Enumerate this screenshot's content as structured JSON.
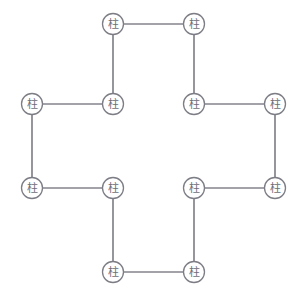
{
  "diagram": {
    "type": "cross-shaped column grid",
    "node_symbol": "柱",
    "node_symbol_name": "column-symbol",
    "node_radius": 10.5,
    "colors": {
      "edge": "#83838b",
      "node_stroke": "#7d7d86",
      "node_fill": "#ffffff",
      "glyph": "#6e6e78",
      "background": "#ffffff"
    },
    "nodes": [
      {
        "id": "C1",
        "label": "柱",
        "x": 113,
        "y": 24,
        "name": "column-node-top-left"
      },
      {
        "id": "C2",
        "label": "柱",
        "x": 194,
        "y": 24,
        "name": "column-node-top-right"
      },
      {
        "id": "C3",
        "label": "柱",
        "x": 194,
        "y": 104,
        "name": "column-node-upper-inner-right"
      },
      {
        "id": "C4",
        "label": "柱",
        "x": 275,
        "y": 104,
        "name": "column-node-right-upper"
      },
      {
        "id": "C5",
        "label": "柱",
        "x": 275,
        "y": 188,
        "name": "column-node-right-lower"
      },
      {
        "id": "C6",
        "label": "柱",
        "x": 194,
        "y": 188,
        "name": "column-node-lower-inner-right"
      },
      {
        "id": "C7",
        "label": "柱",
        "x": 194,
        "y": 272,
        "name": "column-node-bottom-right"
      },
      {
        "id": "C8",
        "label": "柱",
        "x": 113,
        "y": 272,
        "name": "column-node-bottom-left"
      },
      {
        "id": "C9",
        "label": "柱",
        "x": 113,
        "y": 188,
        "name": "column-node-lower-inner-left"
      },
      {
        "id": "C10",
        "label": "柱",
        "x": 32,
        "y": 188,
        "name": "column-node-left-lower"
      },
      {
        "id": "C11",
        "label": "柱",
        "x": 32,
        "y": 104,
        "name": "column-node-left-upper"
      },
      {
        "id": "C12",
        "label": "柱",
        "x": 113,
        "y": 104,
        "name": "column-node-upper-inner-left"
      }
    ],
    "edges": [
      {
        "from": "C1",
        "to": "C2",
        "name": "beam-top"
      },
      {
        "from": "C2",
        "to": "C3",
        "name": "beam-upper-right-vertical"
      },
      {
        "from": "C3",
        "to": "C4",
        "name": "beam-right-upper-horizontal"
      },
      {
        "from": "C4",
        "to": "C5",
        "name": "beam-right-vertical"
      },
      {
        "from": "C5",
        "to": "C6",
        "name": "beam-right-lower-horizontal"
      },
      {
        "from": "C6",
        "to": "C7",
        "name": "beam-lower-right-vertical"
      },
      {
        "from": "C7",
        "to": "C8",
        "name": "beam-bottom"
      },
      {
        "from": "C8",
        "to": "C9",
        "name": "beam-lower-left-vertical"
      },
      {
        "from": "C9",
        "to": "C10",
        "name": "beam-left-lower-horizontal"
      },
      {
        "from": "C10",
        "to": "C11",
        "name": "beam-left-vertical"
      },
      {
        "from": "C11",
        "to": "C12",
        "name": "beam-left-upper-horizontal"
      },
      {
        "from": "C12",
        "to": "C1",
        "name": "beam-upper-left-vertical"
      }
    ]
  }
}
